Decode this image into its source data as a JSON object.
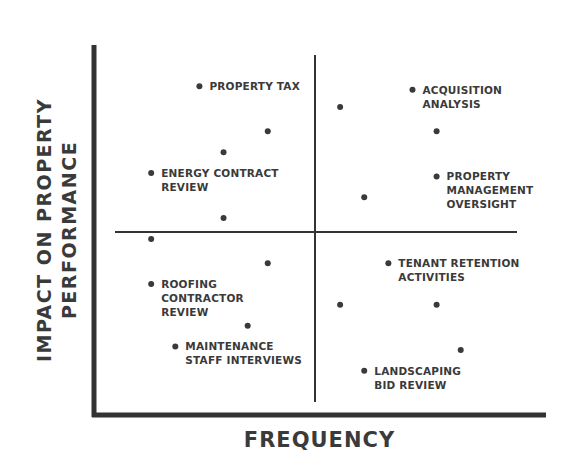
{
  "chart_data": {
    "type": "scatter",
    "title": "",
    "xlabel": "FREQUENCY",
    "ylabel": "IMPACT ON PROPERTY PERFORMANCE",
    "ylabel_lines": [
      "IMPACT ON PROPERTY",
      "PERFORMANCE"
    ],
    "grid": false,
    "legend": null,
    "quadrant_dividers": {
      "x": 0.5,
      "y": 0.5
    },
    "xlim": [
      0,
      1
    ],
    "ylim": [
      0,
      1
    ],
    "points": [
      {
        "x": 0.21,
        "y": 0.91,
        "label": "PROPERTY TAX"
      },
      {
        "x": 0.56,
        "y": 0.85,
        "label": ""
      },
      {
        "x": 0.74,
        "y": 0.9,
        "label": "ACQUISITION\nANALYSIS"
      },
      {
        "x": 0.38,
        "y": 0.78,
        "label": ""
      },
      {
        "x": 0.8,
        "y": 0.78,
        "label": ""
      },
      {
        "x": 0.27,
        "y": 0.72,
        "label": ""
      },
      {
        "x": 0.09,
        "y": 0.66,
        "label": "ENERGY CONTRACT\nREVIEW"
      },
      {
        "x": 0.8,
        "y": 0.65,
        "label": "PROPERTY\nMANAGEMENT\nOVERSIGHT"
      },
      {
        "x": 0.62,
        "y": 0.59,
        "label": ""
      },
      {
        "x": 0.27,
        "y": 0.53,
        "label": ""
      },
      {
        "x": 0.09,
        "y": 0.47,
        "label": ""
      },
      {
        "x": 0.68,
        "y": 0.4,
        "label": "TENANT RETENTION\nACTIVITIES"
      },
      {
        "x": 0.38,
        "y": 0.4,
        "label": ""
      },
      {
        "x": 0.09,
        "y": 0.34,
        "label": "ROOFING\nCONTRACTOR\nREVIEW"
      },
      {
        "x": 0.56,
        "y": 0.28,
        "label": ""
      },
      {
        "x": 0.8,
        "y": 0.28,
        "label": ""
      },
      {
        "x": 0.33,
        "y": 0.22,
        "label": ""
      },
      {
        "x": 0.15,
        "y": 0.16,
        "label": "MAINTENANCE\nSTAFF INTERVIEWS"
      },
      {
        "x": 0.86,
        "y": 0.15,
        "label": ""
      },
      {
        "x": 0.62,
        "y": 0.09,
        "label": "LANDSCAPING\nBID REVIEW"
      }
    ]
  },
  "colors": {
    "ink": "#3a3a3a",
    "axis": "#333333",
    "background": "#ffffff"
  }
}
